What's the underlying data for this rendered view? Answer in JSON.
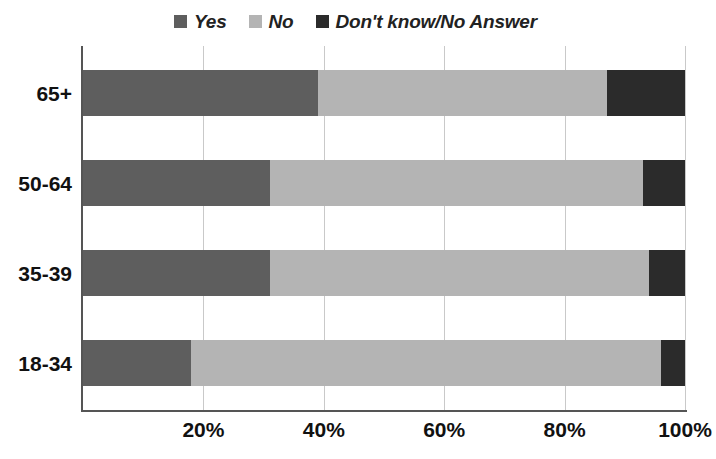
{
  "chart_data": {
    "type": "bar",
    "orientation": "horizontal",
    "stacked": true,
    "normalized_percent": true,
    "title": "",
    "subtitle": "",
    "xlabel": "",
    "ylabel": "",
    "xlim": [
      0,
      100
    ],
    "xticks": [
      20,
      40,
      60,
      80,
      100
    ],
    "xticklabels": [
      "20%",
      "40%",
      "60%",
      "80%",
      "100%"
    ],
    "grid": "vertical",
    "legend_position": "top-center",
    "categories": [
      "65+",
      "50-64",
      "35-39",
      "18-34"
    ],
    "series": [
      {
        "name": "Yes",
        "color": "#5e5e5e",
        "values": [
          39,
          31,
          31,
          18
        ]
      },
      {
        "name": "No",
        "color": "#b4b4b4",
        "values": [
          48,
          62,
          63,
          78
        ]
      },
      {
        "name": "Don't know/No Answer",
        "color": "#2b2b2b",
        "values": [
          13,
          7,
          6,
          4
        ]
      }
    ]
  },
  "legend": {
    "items": [
      {
        "label": "Yes",
        "color": "#5e5e5e"
      },
      {
        "label": "No",
        "color": "#b4b4b4"
      },
      {
        "label": "Don't know/No Answer",
        "color": "#2b2b2b"
      }
    ]
  },
  "axes": {
    "y_categories": [
      "65+",
      "50-64",
      "35-39",
      "18-34"
    ],
    "x_ticklabels": [
      "20%",
      "40%",
      "60%",
      "80%",
      "100%"
    ]
  },
  "colors": {
    "yes": "#5e5e5e",
    "no": "#b4b4b4",
    "dont_know": "#2b2b2b",
    "axis": "#555555",
    "grid": "#c9c9c9",
    "text": "#111111",
    "background": "#ffffff"
  }
}
